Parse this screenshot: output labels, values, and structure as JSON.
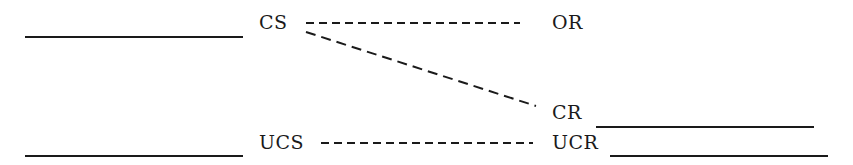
{
  "diagram": {
    "type": "classical-conditioning-schema",
    "labels": {
      "cs": "CS",
      "ucs": "UCS",
      "or": "OR",
      "cr": "CR",
      "ucr": "UCR"
    },
    "connections": [
      {
        "from": "CS",
        "to": "OR",
        "style": "dashed"
      },
      {
        "from": "CS",
        "to": "CR",
        "style": "dashed"
      },
      {
        "from": "UCS",
        "to": "UCR",
        "style": "dashed"
      }
    ],
    "baselines": [
      {
        "near": "CS",
        "side": "left"
      },
      {
        "near": "UCS",
        "side": "left"
      },
      {
        "near": "CR",
        "side": "right"
      },
      {
        "near": "UCR",
        "side": "right"
      }
    ],
    "colors": {
      "ink": "#1a1a1a",
      "background": "#ffffff"
    }
  }
}
